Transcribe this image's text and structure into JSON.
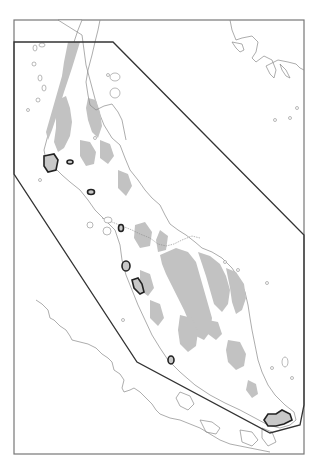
{
  "map": {
    "region": "Malay Peninsula",
    "colors": {
      "highland": "#c2c2c2",
      "coastline": "#8a8a8a",
      "study_polygon": "#333333",
      "site_outline": "#222222",
      "frame": "#777777",
      "background": "#ffffff"
    },
    "frame": {
      "x": 14,
      "y": 20,
      "width": 290,
      "height": 434
    },
    "study_polygon_points": [
      [
        14,
        42
      ],
      [
        113,
        42
      ],
      [
        304,
        235
      ],
      [
        304,
        405
      ],
      [
        300,
        425
      ],
      [
        270,
        433
      ],
      [
        137,
        362
      ],
      [
        14,
        174
      ]
    ],
    "sites": [
      {
        "name": "site-1",
        "cx": 49,
        "cy": 163
      },
      {
        "name": "site-2",
        "cx": 70,
        "cy": 162
      },
      {
        "name": "site-3",
        "cx": 91,
        "cy": 192
      },
      {
        "name": "site-4",
        "cx": 121,
        "cy": 228
      },
      {
        "name": "site-5",
        "cx": 126,
        "cy": 266
      },
      {
        "name": "site-6",
        "cx": 137,
        "cy": 285
      },
      {
        "name": "site-7",
        "cx": 171,
        "cy": 360
      },
      {
        "name": "site-8",
        "cx": 275,
        "cy": 420
      }
    ]
  }
}
